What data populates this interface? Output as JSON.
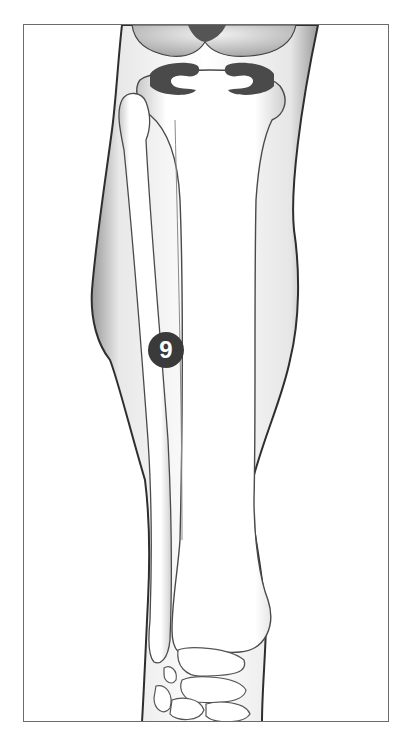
{
  "diagram": {
    "markers": [
      {
        "label": "9",
        "position": "on fibula, mid-shaft"
      }
    ],
    "colors": {
      "outline": "#2e2e2e",
      "bone_fill": "#ffffff",
      "shade": "#b5b5b5",
      "meniscus": "#4a4a4a",
      "marker_bg": "#3a3a3a",
      "marker_text": "#ffffff",
      "frame_border": "#6b6b6b"
    }
  }
}
